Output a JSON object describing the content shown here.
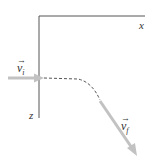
{
  "diagram": {
    "axes": {
      "x_label": "x",
      "z_label": "z",
      "color": "#555555"
    },
    "vectors": {
      "initial": {
        "symbol": "v",
        "subscript": "i",
        "arrow": "→",
        "color": "#bdbdbd"
      },
      "final": {
        "symbol": "v",
        "subscript": "f",
        "arrow": "→",
        "color": "#bdbdbd"
      }
    },
    "path": {
      "style": "dashed",
      "color": "#555555"
    }
  }
}
